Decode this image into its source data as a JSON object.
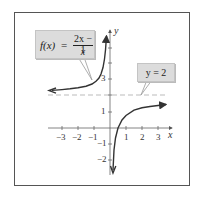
{
  "figure": {
    "function_label": {
      "lhs": "f(x)",
      "equals": "=",
      "numerator": "2x − 1",
      "denominator": "x"
    },
    "asymptote_label": {
      "text": "y = 2"
    },
    "axes": {
      "x_label": "x",
      "y_label": "y",
      "x_ticks": [
        "−3",
        "−2",
        "−1",
        "1",
        "2",
        "3"
      ],
      "y_ticks": [
        "3",
        "1",
        "−1",
        "−2"
      ]
    },
    "colors": {
      "label_box": "#dcdcdc",
      "curve": "#333333",
      "asymptote": "#999999",
      "frame": "#555555"
    }
  }
}
